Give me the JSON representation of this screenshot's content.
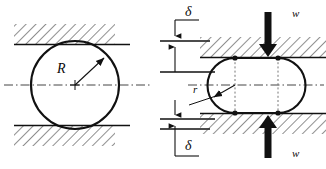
{
  "figure": {
    "colors": {
      "line": "#111111",
      "hatch": "#333333",
      "centerline": "#444444",
      "dotted": "#777777",
      "background": "#ffffff"
    }
  },
  "labels": {
    "radius_undeformed": "R",
    "radius_deformed": "r",
    "gap_top": "δ",
    "gap_bottom": "δ",
    "load_top": "w",
    "load_bottom": "w"
  },
  "left_panel": {
    "name": "undeformed-circle-panel",
    "circle": {
      "cx": 75,
      "cy": 85,
      "r": 44
    },
    "upper_surface": {
      "x": 14,
      "y": 24,
      "width": 101,
      "height": 21
    },
    "lower_surface": {
      "x": 14,
      "y": 125,
      "width": 101,
      "height": 21
    },
    "centerline_y": 85
  },
  "right_panel": {
    "name": "deformed-stadium-panel",
    "stadium": {
      "left_center_x": 235,
      "right_center_x": 278,
      "cy": 85,
      "ry": 27,
      "rx": 27
    },
    "upper_surface": {
      "x": 200,
      "y": 36,
      "width": 126,
      "height": 22
    },
    "lower_surface": {
      "x": 200,
      "y": 113,
      "width": 126,
      "height": 22
    },
    "contact_points": [
      {
        "x": 235,
        "y": 58
      },
      {
        "x": 278,
        "y": 58
      },
      {
        "x": 235,
        "y": 113
      },
      {
        "x": 278,
        "y": 113
      }
    ],
    "load_arrow_top": {
      "x": 268,
      "y_from": 12,
      "y_to": 56
    },
    "load_arrow_bottom": {
      "x": 268,
      "y_from": 158,
      "y_to": 114
    },
    "centerline_y": 85
  },
  "dimensions": {
    "name": "gap-dimension-stack",
    "top_gap": {
      "extension_line_y": 40,
      "reference_line_y": 58,
      "label": "δ"
    },
    "bottom_gap": {
      "extension_line_y": 113,
      "reference_line_y": 128,
      "label": "δ"
    }
  }
}
